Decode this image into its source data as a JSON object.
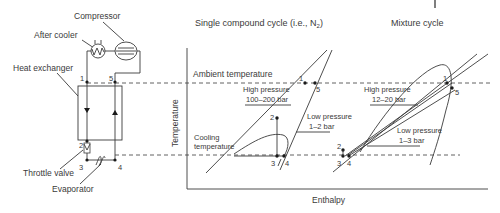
{
  "schematic": {
    "labels": {
      "compressor": "Compressor",
      "after_cooler": "After cooler",
      "heat_exchanger": "Heat exchanger",
      "throttle_valve": "Throttle valve",
      "evaporator": "Evaporator"
    },
    "points": [
      "1",
      "5",
      "2",
      "3",
      "4"
    ]
  },
  "chart": {
    "ylabel": "Temperature",
    "xlabel": "Enthalpy",
    "ambient_label": "Ambient temperature",
    "cooling_label_1": "Cooling",
    "cooling_label_2": "temperature"
  },
  "single_cycle": {
    "title": "Single compound cycle (i.e., N",
    "title_sub": "2",
    "title_end": ")",
    "high_pressure_label": "High pressure",
    "high_pressure_value": "100–200 bar",
    "low_pressure_label": "Low pressure",
    "low_pressure_value": "1–2 bar",
    "points": {
      "p1": "1",
      "p2": "2",
      "p3": "3",
      "p4": "4",
      "p5": "5"
    }
  },
  "mixture_cycle": {
    "title": "Mixture cycle",
    "high_pressure_label": "High pressure",
    "high_pressure_value": "12–20 bar",
    "low_pressure_label": "Low pressure",
    "low_pressure_value": "1–3 bar",
    "points": {
      "p1": "1",
      "p2": "2",
      "p3": "3",
      "p4": "4",
      "p5": "5"
    }
  },
  "page_marker": "|"
}
